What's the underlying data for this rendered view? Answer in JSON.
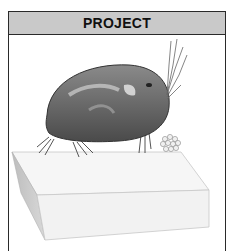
{
  "panel": {
    "title": "PROJECT",
    "header_color": "#c9c9c9",
    "border_color": "#2a2a2a"
  },
  "illustration": {
    "subject": "ostracod (seed shrimp) crustacean with egg cluster on a block",
    "elements": [
      "ostracod-body",
      "antennae",
      "legs",
      "egg-cluster",
      "platform-block"
    ]
  }
}
